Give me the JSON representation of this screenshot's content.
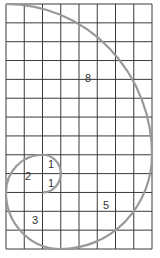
{
  "diagram": {
    "type": "fibonacci-spiral-grid",
    "grid": {
      "columns": 8,
      "rows": 13,
      "line_color": "#3a3a3a"
    },
    "spiral_color": "#999999",
    "squares": [
      {
        "label": "8",
        "size": 8,
        "col": 0,
        "row": 0,
        "label_x": 88,
        "label_y": 82
      },
      {
        "label": "5",
        "size": 5,
        "col": 3,
        "row": 8,
        "label_x": 106,
        "label_y": 209
      },
      {
        "label": "3",
        "size": 3,
        "col": 0,
        "row": 10,
        "label_x": 35,
        "label_y": 224
      },
      {
        "label": "2",
        "size": 2,
        "col": 0,
        "row": 8,
        "label_x": 28,
        "label_y": 180
      },
      {
        "label": "1",
        "size": 1,
        "col": 2,
        "row": 8,
        "label_x": 51,
        "label_y": 168
      },
      {
        "label": "1",
        "size": 1,
        "col": 2,
        "row": 9,
        "label_x": 51,
        "label_y": 187
      }
    ]
  }
}
